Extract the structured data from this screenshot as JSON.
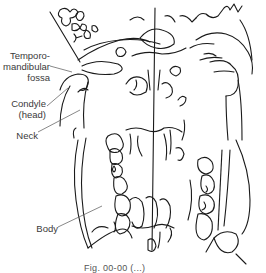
{
  "figure": {
    "type": "anatomical line drawing",
    "labels": [
      {
        "id": "tmj-fossa",
        "lines": [
          "Temporo-",
          "mandibular",
          "fossa"
        ]
      },
      {
        "id": "condyle",
        "lines": [
          "Condyle",
          "(head)"
        ]
      },
      {
        "id": "neck",
        "lines": [
          "Neck"
        ]
      },
      {
        "id": "body",
        "lines": [
          "Body"
        ]
      }
    ],
    "caption": "Fig. 00-00  (...)"
  }
}
